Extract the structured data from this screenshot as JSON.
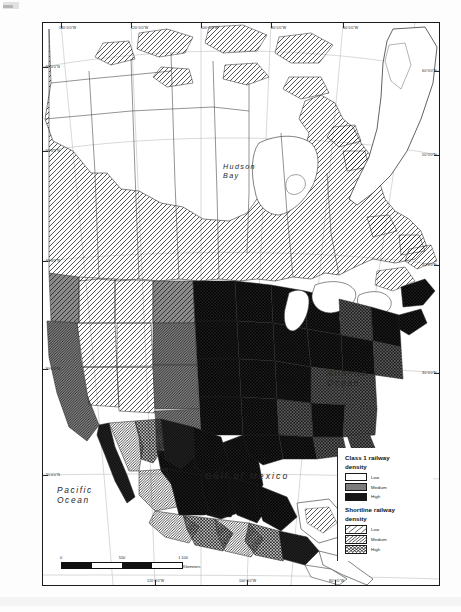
{
  "map": {
    "title": "North America railway density map",
    "places": [
      {
        "name": "Hudson Bay",
        "line1": "Hudson",
        "line2": "Bay"
      },
      {
        "name": "Atlantic Ocean",
        "line1": "Atlantic",
        "line2": "Ocean"
      },
      {
        "name": "Pacific Ocean",
        "line1": "Pacific",
        "line2": "Ocean"
      },
      {
        "name": "Gulf of Mexico",
        "line1": "Gulf of Mexico",
        "line2": ""
      }
    ],
    "ticks": {
      "top": [
        "140°0'0\"W",
        "120°0'0\"W",
        "100°0'0\"W",
        "80°0'0\"W",
        "60°0'0\"W"
      ],
      "bottom": [
        "120°0'0\"W",
        "100°0'0\"W",
        "80°0'0\"W"
      ],
      "left": [
        "60°0'0\"N",
        "50°0'0\"N",
        "40°0'0\"N",
        "30°0'0\"N",
        "20°0'0\"N"
      ],
      "right": [
        "60°0'0\"N",
        "50°0'0\"N",
        "40°0'0\"N",
        "30°0'0\"N"
      ]
    }
  },
  "scalebar": {
    "labels": [
      "0",
      "550",
      "1 100"
    ],
    "units": "Kilometers"
  },
  "legend": {
    "class1": {
      "title_line1": "Class 1 railway",
      "title_line2": "density",
      "items": [
        {
          "label": "Low",
          "fill": "#ffffff",
          "pattern": "solid"
        },
        {
          "label": "Medium",
          "fill": "#7c7c7c",
          "pattern": "solid"
        },
        {
          "label": "High",
          "fill": "#161616",
          "pattern": "solid"
        }
      ]
    },
    "shortline": {
      "title_line1": "Shortline railway",
      "title_line2": "density",
      "items": [
        {
          "label": "Low",
          "pattern": "diag-sparse"
        },
        {
          "label": "Medium",
          "pattern": "diag-dense"
        },
        {
          "label": "High",
          "pattern": "crosshatch"
        }
      ]
    }
  },
  "colors": {
    "low": "#ffffff",
    "medium": "#7c7c7c",
    "high": "#161616",
    "frame": "#1a1a1a",
    "graticule": "#b9b9b9",
    "text": "#1d1d1d"
  }
}
